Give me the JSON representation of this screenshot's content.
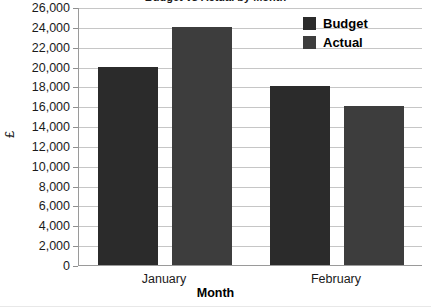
{
  "chart_data": {
    "type": "bar",
    "title": "Budget vs Actual by Month",
    "xlabel": "Month",
    "ylabel": "£",
    "categories": [
      "January",
      "February"
    ],
    "series": [
      {
        "name": "Budget",
        "values": [
          20000,
          18000
        ],
        "color": "#2b2b2b"
      },
      {
        "name": "Actual",
        "values": [
          24000,
          16000
        ],
        "color": "#3d3d3d"
      }
    ],
    "ylim": [
      0,
      26000
    ],
    "ytick_step": 2000,
    "ytick_labels": [
      "26,000",
      "24,000",
      "22,000",
      "20,000",
      "18,000",
      "16,000",
      "14,000",
      "12,000",
      "10,000",
      "8,000",
      "6,000",
      "4,000",
      "2,000",
      "0"
    ],
    "grid": true,
    "legend_position": "top-right"
  },
  "legend": {
    "entries": [
      {
        "label": "Budget",
        "color": "#2b2b2b"
      },
      {
        "label": "Actual",
        "color": "#3d3d3d"
      }
    ]
  },
  "colors": {
    "budget": "#2b2b2b",
    "actual": "#3d3d3d",
    "gridline": "#c6c6c6",
    "axis": "#9a9a9a",
    "background": "#ffffff",
    "text": "#1a1a1a"
  }
}
